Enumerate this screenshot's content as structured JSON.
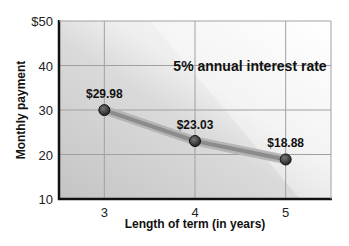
{
  "chart_data": {
    "type": "line",
    "title": "5% annual interest rate",
    "xlabel": "Length of term (in years)",
    "ylabel": "Monthly payment",
    "x": [
      3,
      4,
      5
    ],
    "values": [
      29.98,
      23.03,
      18.88
    ],
    "data_labels": [
      "$29.98",
      "$23.03",
      "$18.88"
    ],
    "xticks": [
      "3",
      "4",
      "5"
    ],
    "yticks": [
      "10",
      "20",
      "30",
      "40",
      "$50"
    ],
    "ylim": [
      10,
      50
    ],
    "xlim": [
      2.5,
      5.5
    ],
    "grid": true,
    "legend": null
  },
  "colors": {
    "line": "#8c8c8c",
    "marker": "#3a3a3a",
    "grid": "#9a9a9a",
    "axis": "#111111"
  }
}
